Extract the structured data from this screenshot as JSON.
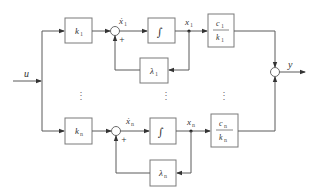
{
  "diagram": {
    "type": "block-diagram",
    "input": {
      "label": "u"
    },
    "output": {
      "label": "y"
    },
    "rows": [
      {
        "index": "1",
        "gain_block": {
          "symbol": "k",
          "subscript": "1"
        },
        "sum_label": {
          "symbol": "ẋ",
          "subscript": "1"
        },
        "sum_sign": "+",
        "integrator": {
          "symbol": "∫"
        },
        "state_label": {
          "symbol": "x",
          "subscript": "1"
        },
        "output_block": {
          "numerator": "c",
          "numerator_sub": "1",
          "denominator": "k",
          "denominator_sub": "1"
        },
        "feedback_block": {
          "symbol": "λ",
          "subscript": "1"
        }
      },
      {
        "index": "n",
        "gain_block": {
          "symbol": "k",
          "subscript": "n"
        },
        "sum_label": {
          "symbol": "ẋ",
          "subscript": "n"
        },
        "sum_sign": "+",
        "integrator": {
          "symbol": "∫"
        },
        "state_label": {
          "symbol": "x",
          "subscript": "n"
        },
        "output_block": {
          "numerator": "c",
          "numerator_sub": "n",
          "denominator": "k",
          "denominator_sub": "n"
        },
        "feedback_block": {
          "symbol": "λ",
          "subscript": "n"
        }
      }
    ],
    "ellipsis": "⋮"
  }
}
